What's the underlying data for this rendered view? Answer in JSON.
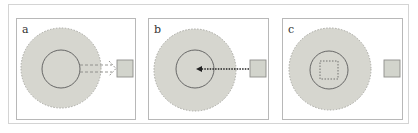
{
  "figure": {
    "panels": [
      {
        "label": "a",
        "description": "Contents of dashed outer region move outward (double dashed arrow) to the external square"
      },
      {
        "label": "b",
        "description": "External square sends a dotted arrow into the center of the inner circle"
      },
      {
        "label": "c",
        "description": "Dashed square appears inside the inner circle; external square remains"
      }
    ]
  },
  "colors": {
    "region_fill": "#d6d6cf",
    "region_border": "#a8a8a2",
    "inner_circle_stroke": "#5a5a5a",
    "square_fill": "#d2d4cc",
    "square_stroke": "#8e8e8a",
    "arrow_a": "#8a8a86",
    "arrow_b": "#222222",
    "panel_border": "#b8b8b8"
  }
}
